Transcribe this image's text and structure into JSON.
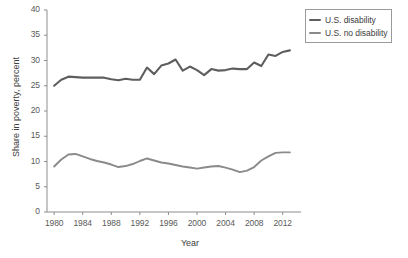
{
  "chart_data": {
    "type": "line",
    "title": "",
    "xlabel": "Year",
    "ylabel": "Share in poverty, percent",
    "xlim": [
      1979,
      2014
    ],
    "ylim": [
      0,
      40
    ],
    "grid": false,
    "legend_position": "top-right",
    "y_ticks": [
      0,
      5,
      10,
      15,
      20,
      25,
      30,
      35,
      40
    ],
    "y_tick_labels": [
      "0",
      "5",
      "10",
      "15",
      "20",
      "25",
      "30",
      "35",
      "40"
    ],
    "x_ticks": [
      1980,
      1984,
      1988,
      1992,
      1996,
      2000,
      2004,
      2008,
      2012
    ],
    "x_tick_labels": [
      "1980",
      "1984",
      "1988",
      "1992",
      "1996",
      "2000",
      "2004",
      "2008",
      "2012"
    ],
    "x": [
      1980,
      1981,
      1982,
      1983,
      1984,
      1985,
      1986,
      1987,
      1988,
      1989,
      1990,
      1991,
      1992,
      1993,
      1994,
      1995,
      1996,
      1997,
      1998,
      1999,
      2000,
      2001,
      2002,
      2003,
      2004,
      2005,
      2006,
      2007,
      2008,
      2009,
      2010,
      2011,
      2012,
      2013
    ],
    "series": [
      {
        "name": "U.S. disability",
        "color": "#5e5e5e",
        "width": 2.1,
        "values": [
          25.0,
          26.2,
          26.8,
          26.7,
          26.6,
          26.6,
          26.6,
          26.6,
          26.3,
          26.1,
          26.4,
          26.2,
          26.2,
          28.6,
          27.3,
          29.0,
          29.4,
          30.2,
          28.0,
          28.8,
          28.1,
          27.1,
          28.3,
          28.0,
          28.1,
          28.4,
          28.3,
          28.3,
          29.6,
          28.9,
          31.2,
          30.9,
          31.7,
          32.0
        ]
      },
      {
        "name": "U.S. no disability",
        "color": "#8a8a8a",
        "width": 1.9,
        "values": [
          9.0,
          10.4,
          11.4,
          11.5,
          11.0,
          10.5,
          10.1,
          9.8,
          9.4,
          8.9,
          9.1,
          9.5,
          10.1,
          10.6,
          10.2,
          9.8,
          9.6,
          9.3,
          9.0,
          8.8,
          8.6,
          8.8,
          9.0,
          9.1,
          8.8,
          8.4,
          7.9,
          8.2,
          8.9,
          10.2,
          11.0,
          11.7,
          11.8,
          11.8
        ]
      }
    ]
  },
  "legend": {
    "items": [
      {
        "label": "U.S. disability"
      },
      {
        "label": "U.S. no disability"
      }
    ]
  }
}
